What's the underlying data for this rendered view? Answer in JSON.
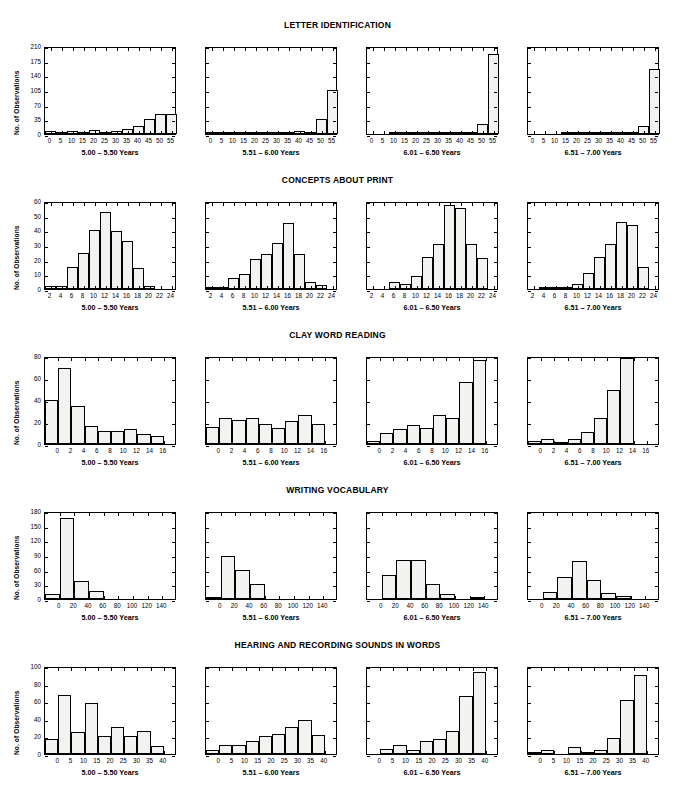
{
  "figure": {
    "y_axis_label": "No. of Observations",
    "age_groups": [
      "5.00 – 5.50 Years",
      "5.51 – 6.00 Years",
      "6.01 – 6.50 Years",
      "6.51 – 7.00 Years"
    ]
  },
  "chart_data": [
    {
      "type": "bar",
      "title": "LETTER IDENTIFICATION",
      "xlabel": "",
      "ylabel": "No. of Observations",
      "ylim": [
        0,
        210
      ],
      "yticks": [
        0,
        35,
        70,
        105,
        140,
        175,
        210
      ],
      "xlim": [
        -2.5,
        57.5
      ],
      "xticks": [
        0,
        5,
        10,
        15,
        20,
        25,
        30,
        35,
        40,
        45,
        50,
        55
      ],
      "bin_width": 5,
      "bin_centers": [
        0,
        5,
        10,
        15,
        20,
        25,
        30,
        35,
        40,
        45,
        50,
        55
      ],
      "grid": false,
      "legend": "none",
      "panels": [
        {
          "name": "5.00 – 5.50 Years",
          "values": [
            7,
            4,
            7,
            4,
            9,
            6,
            7,
            12,
            19,
            37,
            47,
            47
          ]
        },
        {
          "name": "5.51 – 6.00 Years",
          "values": [
            1,
            1,
            1,
            2,
            2,
            1,
            1,
            2,
            7,
            4,
            35,
            105
          ]
        },
        {
          "name": "6.01 – 6.50 Years",
          "values": [
            0,
            0,
            1,
            1,
            2,
            1,
            1,
            1,
            2,
            3,
            23,
            190
          ]
        },
        {
          "name": "6.51 – 7.00 Years",
          "values": [
            0,
            0,
            0,
            1,
            1,
            1,
            1,
            1,
            1,
            2,
            18,
            155
          ]
        }
      ]
    },
    {
      "type": "bar",
      "title": "CONCEPTS ABOUT PRINT",
      "xlabel": "",
      "ylabel": "No. of Observations",
      "ylim": [
        0,
        60
      ],
      "yticks": [
        0,
        10,
        20,
        30,
        40,
        50,
        60
      ],
      "xlim": [
        1,
        25
      ],
      "xticks": [
        2,
        4,
        6,
        8,
        10,
        12,
        14,
        16,
        18,
        20,
        22,
        24
      ],
      "bin_width": 2,
      "bin_centers": [
        2,
        4,
        6,
        8,
        10,
        12,
        14,
        16,
        18,
        20,
        22,
        24
      ],
      "grid": false,
      "legend": "none",
      "panels": [
        {
          "name": "5.00 – 5.50 Years",
          "values": [
            2,
            2,
            15,
            24.5,
            40,
            52.5,
            39.5,
            32.5,
            14.5,
            2,
            0,
            0
          ]
        },
        {
          "name": "5.51 – 6.00 Years",
          "values": [
            1,
            1,
            7.5,
            10,
            20.5,
            24,
            31.5,
            45,
            24,
            5,
            3,
            0
          ]
        },
        {
          "name": "6.01 – 6.50 Years",
          "values": [
            0,
            0,
            4.5,
            3.5,
            9,
            21.5,
            30.5,
            57,
            55,
            31,
            21,
            0
          ]
        },
        {
          "name": "6.51 – 7.00 Years",
          "values": [
            0,
            1.5,
            1,
            1.5,
            3.5,
            11,
            21.5,
            30.5,
            45.5,
            43.5,
            15,
            0
          ]
        }
      ]
    },
    {
      "type": "bar",
      "title": "CLAY WORD READING",
      "xlabel": "",
      "ylabel": "No. of Observations",
      "ylim": [
        0,
        80
      ],
      "yticks": [
        0,
        20,
        40,
        60,
        80
      ],
      "xlim": [
        -2,
        18
      ],
      "xticks": [
        0,
        2,
        4,
        6,
        8,
        10,
        12,
        14,
        16
      ],
      "bin_width": 2,
      "bin_centers": [
        -1,
        1,
        3,
        5,
        7,
        9,
        11,
        13,
        15
      ],
      "grid": false,
      "legend": "none",
      "panels": [
        {
          "name": "5.00 – 5.50 Years",
          "values": [
            40,
            69.5,
            35,
            16,
            12,
            12,
            14,
            9.5,
            7
          ]
        },
        {
          "name": "5.51 – 6.00 Years",
          "values": [
            15.5,
            23.5,
            22,
            24,
            18,
            14.5,
            21,
            26.5,
            18
          ]
        },
        {
          "name": "6.01 – 6.50 Years",
          "values": [
            3,
            10,
            13.5,
            17,
            15,
            26,
            24,
            56,
            76.5
          ]
        },
        {
          "name": "6.51 – 7.00 Years",
          "values": [
            3,
            5,
            1.5,
            4.5,
            11,
            24,
            49,
            78,
            0
          ]
        }
      ]
    },
    {
      "type": "bar",
      "title": "WRITING VOCABULARY",
      "xlabel": "",
      "ylabel": "No. of Observations",
      "ylim": [
        0,
        180
      ],
      "yticks": [
        0,
        30,
        60,
        90,
        120,
        150,
        180
      ],
      "xlim": [
        -20,
        160
      ],
      "xticks": [
        0,
        20,
        40,
        60,
        80,
        100,
        120,
        140
      ],
      "bin_width": 20,
      "bin_centers": [
        -10,
        10,
        30,
        50,
        70,
        90,
        110,
        130,
        150
      ],
      "grid": false,
      "legend": "none",
      "panels": [
        {
          "name": "5.00 – 5.50 Years",
          "values": [
            11,
            165,
            37,
            17,
            0,
            0,
            0,
            0,
            0
          ]
        },
        {
          "name": "5.51 – 6.00 Years",
          "values": [
            1.5,
            88,
            60,
            30,
            0,
            0,
            0,
            0,
            0
          ]
        },
        {
          "name": "6.01 – 6.50 Years",
          "values": [
            0,
            49,
            79,
            79,
            31,
            10,
            0,
            2,
            0
          ]
        },
        {
          "name": "6.51 – 7.00 Years",
          "values": [
            0,
            15,
            46,
            77,
            39,
            13,
            7,
            0,
            0
          ]
        }
      ]
    },
    {
      "type": "bar",
      "title": "HEARING AND RECORDING SOUNDS IN WORDS",
      "xlabel": "",
      "ylabel": "No. of Observations",
      "ylim": [
        0,
        100
      ],
      "yticks": [
        0,
        20,
        40,
        60,
        80,
        100
      ],
      "xlim": [
        -5,
        45
      ],
      "xticks": [
        0,
        5,
        10,
        15,
        20,
        25,
        30,
        35,
        40
      ],
      "bin_width": 5,
      "bin_centers": [
        -2.5,
        2.5,
        7.5,
        12.5,
        17.5,
        22.5,
        27.5,
        32.5,
        37.5
      ],
      "grid": false,
      "legend": "none",
      "panels": [
        {
          "name": "5.00 – 5.50 Years",
          "values": [
            17,
            66.5,
            25.5,
            57.5,
            21,
            30.5,
            21,
            26,
            9.5
          ]
        },
        {
          "name": "5.51 – 6.00 Years",
          "values": [
            4,
            10,
            10,
            15,
            21,
            22.5,
            31,
            39,
            22
          ]
        },
        {
          "name": "6.01 – 6.50 Years",
          "values": [
            0,
            6,
            10,
            5,
            14.5,
            16.5,
            26.5,
            65.5,
            93
          ]
        },
        {
          "name": "6.51 – 7.00 Years",
          "values": [
            2,
            4,
            0,
            8,
            2,
            4,
            18.5,
            61,
            90
          ]
        }
      ]
    }
  ]
}
